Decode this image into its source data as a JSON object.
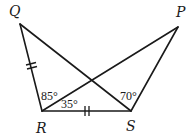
{
  "figure": {
    "type": "geometry",
    "vertices": {
      "Q": {
        "label": "Q",
        "x": 20,
        "y": 24
      },
      "P": {
        "label": "P",
        "x": 178,
        "y": 27
      },
      "R": {
        "label": "R",
        "x": 42,
        "y": 111
      },
      "S": {
        "label": "S",
        "x": 131,
        "y": 111
      }
    },
    "segments": [
      "QR",
      "QS",
      "RS",
      "RP",
      "SP"
    ],
    "congruent_marks": [
      {
        "segment": "QR",
        "ticks": 2
      },
      {
        "segment": "RS",
        "ticks": 2
      }
    ],
    "angles": {
      "QRP": {
        "label": "85°"
      },
      "PRS": {
        "label": "35°"
      },
      "QSR": {
        "label": "70°"
      }
    }
  }
}
